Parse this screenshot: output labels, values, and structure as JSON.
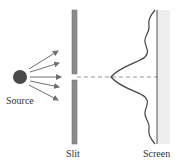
{
  "diagram": {
    "labels": {
      "source": "Source",
      "slit": "Slit",
      "screen": "Screen"
    },
    "colors": {
      "source_fill": "#4a4a4a",
      "arrow": "#707070",
      "slit_bar": "#8c8c8c",
      "screen_line": "#555555",
      "screen_shade": "#eeeeee",
      "curve": "#444444",
      "axis_dashed": "#999999"
    },
    "arrow_count": 5
  }
}
